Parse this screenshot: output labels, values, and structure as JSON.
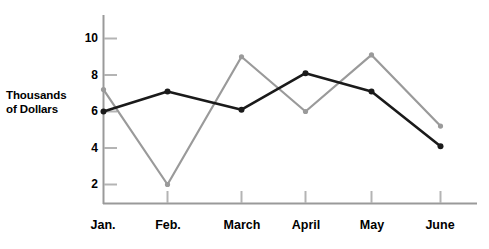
{
  "chart_data": {
    "type": "line",
    "title": "",
    "xlabel": "",
    "ylabel": "Thousands of Dollars",
    "categories": [
      "Jan.",
      "Feb.",
      "March",
      "April",
      "May",
      "June"
    ],
    "yticks": [
      2,
      4,
      6,
      8,
      10
    ],
    "ylim": [
      0,
      11
    ],
    "grid": false,
    "legend": "none",
    "series": [
      {
        "name": "series-black",
        "color": "#1a1a1a",
        "values": [
          6.0,
          7.1,
          6.1,
          8.1,
          7.1,
          4.1
        ]
      },
      {
        "name": "series-gray",
        "color": "#9a9a9a",
        "values": [
          7.2,
          2.0,
          9.0,
          6.0,
          9.1,
          5.2
        ]
      }
    ]
  },
  "axis": {
    "y_title_line1": "Thousands",
    "y_title_line2": "of Dollars",
    "y_tick_labels": [
      "10",
      "8",
      "6",
      "4",
      "2"
    ],
    "x_tick_labels": [
      "Jan.",
      "Feb.",
      "March",
      "April",
      "May",
      "June"
    ]
  },
  "colors": {
    "axis": "#9a9a9a",
    "series_black": "#1a1a1a",
    "series_gray": "#9a9a9a",
    "background": "#ffffff",
    "text": "#000000"
  }
}
